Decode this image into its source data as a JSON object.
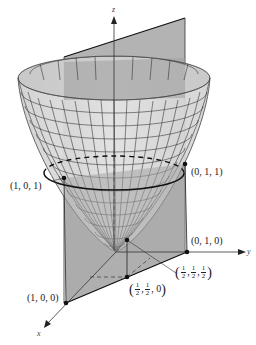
{
  "figure": {
    "axes": {
      "x": "x",
      "y": "y",
      "z": "z"
    },
    "colors": {
      "surface": "#d9d9d9",
      "surface_inner": "#bdbdbd",
      "plane": "#a8a8a8",
      "mesh": "#222222",
      "curve": "#111111"
    },
    "points": [
      {
        "id": "p101",
        "label": "(1, 0, 1)"
      },
      {
        "id": "p011",
        "label": "(0, 1, 1)"
      },
      {
        "id": "p010",
        "label": "(0, 1, 0)"
      },
      {
        "id": "p100",
        "label": "(1, 0, 0)"
      },
      {
        "id": "phalf0",
        "label": "(1/2, 1/2, 0)",
        "parts": [
          "1",
          "2",
          "1",
          "2",
          "0"
        ]
      },
      {
        "id": "phalfhalf",
        "label": "(1/2, 1/2, 1/2)",
        "parts": [
          "1",
          "2",
          "1",
          "2",
          "1",
          "2"
        ]
      }
    ]
  }
}
